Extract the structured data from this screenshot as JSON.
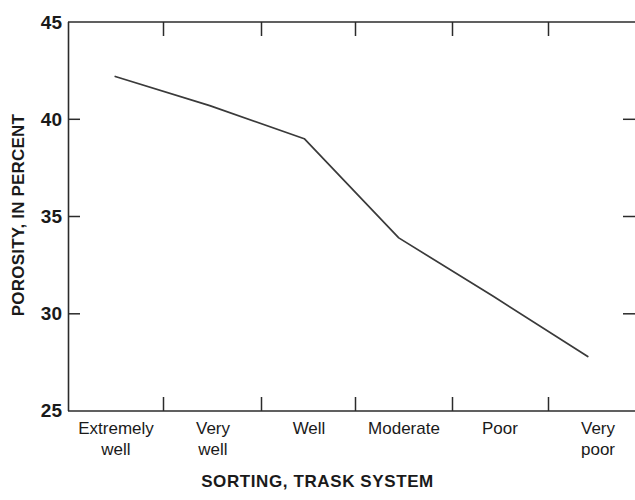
{
  "chart_data": {
    "type": "line",
    "title": "",
    "xlabel": "SORTING, TRASK SYSTEM",
    "ylabel": "POROSITY, IN PERCENT",
    "categories": [
      "Extremely well",
      "Very well",
      "Well",
      "Moderate",
      "Poor",
      "Very poor"
    ],
    "category_lines": [
      [
        "Extremely",
        "well"
      ],
      [
        "Very",
        "well"
      ],
      [
        "Well",
        ""
      ],
      [
        "Moderate",
        ""
      ],
      [
        "Poor",
        ""
      ],
      [
        "Very",
        "poor"
      ]
    ],
    "values": [
      42.2,
      40.7,
      39.0,
      33.9,
      30.9,
      27.8
    ],
    "ylim": [
      25,
      45
    ],
    "yticks": [
      25,
      30,
      35,
      40,
      45
    ],
    "ytick_labels": [
      "25",
      "30",
      "35",
      "40",
      "45"
    ],
    "grid": false,
    "legend": null,
    "line_color": "#3a3a3a",
    "axis_color": "#2b2b2b",
    "background": "#ffffff"
  },
  "axis": {
    "y_labels": [
      "45",
      "40",
      "35",
      "30",
      "25"
    ],
    "x_title": "SORTING, TRASK SYSTEM",
    "y_title": "POROSITY, IN PERCENT"
  }
}
